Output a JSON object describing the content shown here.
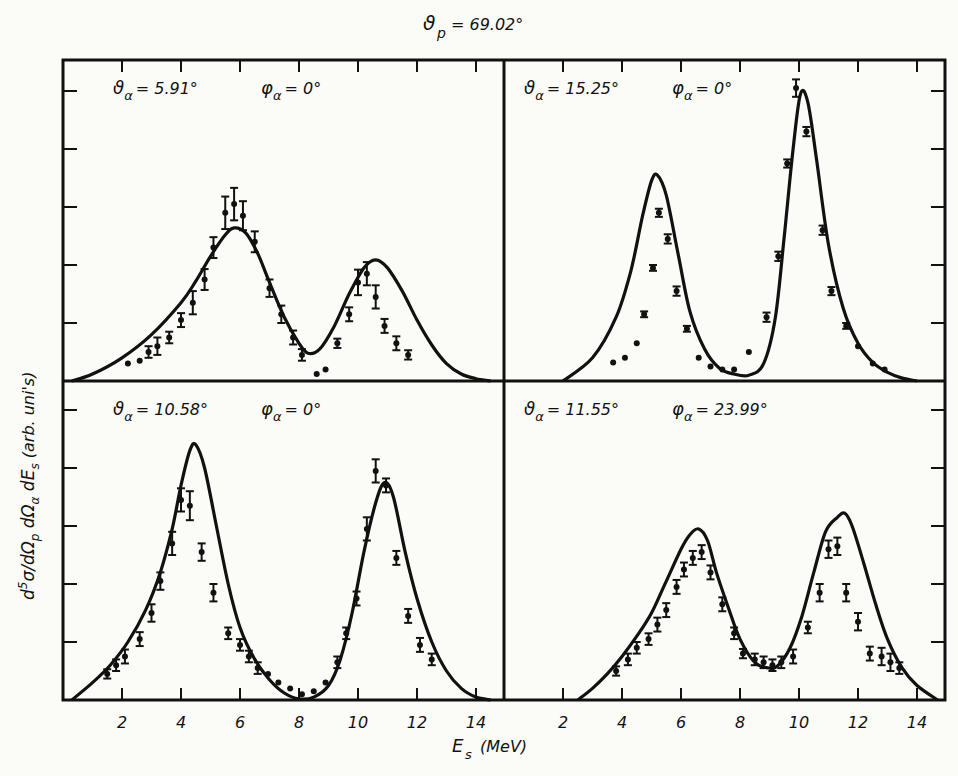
{
  "chart_data": {
    "type": "line",
    "title_parts": {
      "symbol": "ϑ",
      "sub": "p",
      "value": "= 69.02°"
    },
    "xlabel": "Es (MeV)",
    "xlabel_parts": {
      "symbol": "E",
      "sub": "s",
      "unit": "(MeV)"
    },
    "ylabel": "d5σ/dΩp dΩα dEs (arb. units)",
    "ylabel_parts": [
      {
        "t": "d",
        "sup": "5",
        "t2": "σ/dΩ",
        "sub": "p"
      },
      {
        "t": " dΩ",
        "sub": "α"
      },
      {
        "t": " dE",
        "sub": "s"
      },
      {
        "t": "  (arb. uni's)"
      }
    ],
    "x_ticks": [
      2,
      4,
      6,
      8,
      10,
      12,
      14
    ],
    "xlim": [
      0,
      15
    ],
    "ylim": [
      0,
      5.5
    ],
    "y_tick_step": 1,
    "grid": false,
    "legend": null,
    "panels": [
      {
        "id": "top-left",
        "theta_label": "ϑα = 5.91°",
        "phi_label": "φα = 0°",
        "theta": {
          "sym": "ϑ",
          "sub": "α",
          "val": "= 5.91°"
        },
        "phi": {
          "sym": "φ",
          "sub": "α",
          "val": "= 0°"
        },
        "curve": {
          "x": [
            0.3,
            1,
            2,
            3,
            4,
            4.5,
            5,
            5.5,
            5.8,
            6.2,
            6.6,
            7,
            7.5,
            8,
            8.3,
            8.7,
            9.2,
            9.7,
            10.2,
            10.6,
            11,
            11.5,
            12,
            12.5,
            13,
            13.5,
            14,
            14.5
          ],
          "y": [
            0,
            0.12,
            0.4,
            0.8,
            1.35,
            1.72,
            2.15,
            2.52,
            2.64,
            2.55,
            2.2,
            1.7,
            1.1,
            0.65,
            0.48,
            0.55,
            0.95,
            1.5,
            1.95,
            2.09,
            1.95,
            1.55,
            1.05,
            0.62,
            0.3,
            0.12,
            0.04,
            0
          ]
        },
        "points": [
          {
            "x": 2.2,
            "y": 0.3,
            "e": 0
          },
          {
            "x": 2.6,
            "y": 0.35,
            "e": 0
          },
          {
            "x": 2.9,
            "y": 0.5,
            "e": 0.1
          },
          {
            "x": 3.2,
            "y": 0.6,
            "e": 0.15
          },
          {
            "x": 3.6,
            "y": 0.75,
            "e": 0.1
          },
          {
            "x": 4.0,
            "y": 1.05,
            "e": 0.12
          },
          {
            "x": 4.4,
            "y": 1.35,
            "e": 0.2
          },
          {
            "x": 4.8,
            "y": 1.75,
            "e": 0.18
          },
          {
            "x": 5.1,
            "y": 2.3,
            "e": 0.18
          },
          {
            "x": 5.5,
            "y": 2.9,
            "e": 0.28
          },
          {
            "x": 5.8,
            "y": 3.05,
            "e": 0.28
          },
          {
            "x": 6.1,
            "y": 2.85,
            "e": 0.25
          },
          {
            "x": 6.5,
            "y": 2.4,
            "e": 0.18
          },
          {
            "x": 7.0,
            "y": 1.6,
            "e": 0.15
          },
          {
            "x": 7.4,
            "y": 1.15,
            "e": 0.15
          },
          {
            "x": 7.8,
            "y": 0.75,
            "e": 0.12
          },
          {
            "x": 8.1,
            "y": 0.45,
            "e": 0.1
          },
          {
            "x": 8.6,
            "y": 0.12,
            "e": 0
          },
          {
            "x": 8.9,
            "y": 0.2,
            "e": 0
          },
          {
            "x": 9.3,
            "y": 0.65,
            "e": 0.08
          },
          {
            "x": 9.7,
            "y": 1.15,
            "e": 0.12
          },
          {
            "x": 10.0,
            "y": 1.7,
            "e": 0.22
          },
          {
            "x": 10.3,
            "y": 1.85,
            "e": 0.2
          },
          {
            "x": 10.6,
            "y": 1.45,
            "e": 0.2
          },
          {
            "x": 10.9,
            "y": 0.95,
            "e": 0.12
          },
          {
            "x": 11.3,
            "y": 0.65,
            "e": 0.12
          },
          {
            "x": 11.7,
            "y": 0.45,
            "e": 0.08
          }
        ]
      },
      {
        "id": "top-right",
        "theta_label": "ϑα = 15.25°",
        "phi_label": "φα = 0°",
        "theta": {
          "sym": "ϑ",
          "sub": "α",
          "val": "= 15.25°"
        },
        "phi": {
          "sym": "φ",
          "sub": "α",
          "val": "= 0°"
        },
        "curve": {
          "x": [
            2,
            3,
            3.8,
            4.3,
            4.7,
            5.0,
            5.2,
            5.5,
            5.9,
            6.3,
            6.8,
            7.3,
            7.8,
            8.3,
            8.8,
            9.2,
            9.5,
            9.8,
            10.05,
            10.3,
            10.6,
            11,
            11.5,
            12,
            12.5,
            13,
            13.5,
            14
          ],
          "y": [
            0,
            0.4,
            1.1,
            1.9,
            2.85,
            3.45,
            3.55,
            3.2,
            2.2,
            1.2,
            0.55,
            0.22,
            0.12,
            0.1,
            0.3,
            1.1,
            2.5,
            4.0,
            4.95,
            4.8,
            3.8,
            2.35,
            1.25,
            0.65,
            0.32,
            0.15,
            0.05,
            0
          ]
        },
        "points": [
          {
            "x": 3.7,
            "y": 0.32,
            "e": 0
          },
          {
            "x": 4.1,
            "y": 0.4,
            "e": 0
          },
          {
            "x": 4.5,
            "y": 0.65,
            "e": 0
          },
          {
            "x": 4.75,
            "y": 1.15,
            "e": 0.05
          },
          {
            "x": 5.05,
            "y": 1.95,
            "e": 0.05
          },
          {
            "x": 5.25,
            "y": 2.9,
            "e": 0.07
          },
          {
            "x": 5.55,
            "y": 2.45,
            "e": 0.08
          },
          {
            "x": 5.85,
            "y": 1.55,
            "e": 0.08
          },
          {
            "x": 6.2,
            "y": 0.9,
            "e": 0.05
          },
          {
            "x": 6.6,
            "y": 0.4,
            "e": 0
          },
          {
            "x": 7.0,
            "y": 0.25,
            "e": 0
          },
          {
            "x": 7.4,
            "y": 0.2,
            "e": 0
          },
          {
            "x": 7.8,
            "y": 0.2,
            "e": 0
          },
          {
            "x": 8.3,
            "y": 0.5,
            "e": 0
          },
          {
            "x": 8.9,
            "y": 1.1,
            "e": 0.08
          },
          {
            "x": 9.3,
            "y": 2.15,
            "e": 0.08
          },
          {
            "x": 9.6,
            "y": 3.75,
            "e": 0.07
          },
          {
            "x": 9.9,
            "y": 5.05,
            "e": 0.15
          },
          {
            "x": 10.25,
            "y": 4.3,
            "e": 0.08
          },
          {
            "x": 10.8,
            "y": 2.6,
            "e": 0.08
          },
          {
            "x": 11.1,
            "y": 1.55,
            "e": 0.07
          },
          {
            "x": 11.6,
            "y": 0.95,
            "e": 0.05
          },
          {
            "x": 12.0,
            "y": 0.6,
            "e": 0
          },
          {
            "x": 12.5,
            "y": 0.3,
            "e": 0
          },
          {
            "x": 12.9,
            "y": 0.2,
            "e": 0
          }
        ]
      },
      {
        "id": "bottom-left",
        "theta_label": "ϑα = 10.58°",
        "phi_label": "φα = 0°",
        "theta": {
          "sym": "ϑ",
          "sub": "α",
          "val": "= 10.58°"
        },
        "phi": {
          "sym": "φ",
          "sub": "α",
          "val": "= 0°"
        },
        "curve": {
          "x": [
            0.3,
            1,
            1.6,
            2.2,
            2.8,
            3.3,
            3.7,
            4.0,
            4.3,
            4.5,
            4.8,
            5.2,
            5.6,
            6.0,
            6.5,
            7,
            7.5,
            8,
            8.5,
            9,
            9.4,
            9.8,
            10.2,
            10.6,
            10.9,
            11.2,
            11.6,
            12,
            12.5,
            13,
            13.5,
            14,
            14.5
          ],
          "y": [
            0,
            0.3,
            0.6,
            1.0,
            1.55,
            2.2,
            2.95,
            3.7,
            4.3,
            4.4,
            4.0,
            3.0,
            2.0,
            1.25,
            0.7,
            0.35,
            0.12,
            0.02,
            0.05,
            0.25,
            0.7,
            1.5,
            2.55,
            3.4,
            3.75,
            3.5,
            2.55,
            1.75,
            1.0,
            0.5,
            0.2,
            0.05,
            0
          ]
        },
        "points": [
          {
            "x": 1.5,
            "y": 0.45,
            "e": 0.08
          },
          {
            "x": 1.8,
            "y": 0.6,
            "e": 0.1
          },
          {
            "x": 2.1,
            "y": 0.75,
            "e": 0.12
          },
          {
            "x": 2.6,
            "y": 1.05,
            "e": 0.12
          },
          {
            "x": 3.0,
            "y": 1.5,
            "e": 0.15
          },
          {
            "x": 3.3,
            "y": 2.05,
            "e": 0.15
          },
          {
            "x": 3.7,
            "y": 2.7,
            "e": 0.2
          },
          {
            "x": 4.0,
            "y": 3.45,
            "e": 0.2
          },
          {
            "x": 4.3,
            "y": 3.35,
            "e": 0.25
          },
          {
            "x": 4.7,
            "y": 2.55,
            "e": 0.15
          },
          {
            "x": 5.1,
            "y": 1.85,
            "e": 0.15
          },
          {
            "x": 5.6,
            "y": 1.15,
            "e": 0.1
          },
          {
            "x": 6.0,
            "y": 0.95,
            "e": 0.1
          },
          {
            "x": 6.3,
            "y": 0.75,
            "e": 0.1
          },
          {
            "x": 6.6,
            "y": 0.55,
            "e": 0.1
          },
          {
            "x": 6.95,
            "y": 0.45,
            "e": 0
          },
          {
            "x": 7.3,
            "y": 0.3,
            "e": 0
          },
          {
            "x": 7.7,
            "y": 0.2,
            "e": 0
          },
          {
            "x": 8.1,
            "y": 0.1,
            "e": 0
          },
          {
            "x": 8.5,
            "y": 0.15,
            "e": 0
          },
          {
            "x": 8.9,
            "y": 0.3,
            "e": 0
          },
          {
            "x": 9.3,
            "y": 0.65,
            "e": 0.1
          },
          {
            "x": 9.6,
            "y": 1.15,
            "e": 0.1
          },
          {
            "x": 9.95,
            "y": 1.75,
            "e": 0.12
          },
          {
            "x": 10.3,
            "y": 2.95,
            "e": 0.2
          },
          {
            "x": 10.6,
            "y": 3.95,
            "e": 0.2
          },
          {
            "x": 10.95,
            "y": 3.7,
            "e": 0.12
          },
          {
            "x": 11.3,
            "y": 2.45,
            "e": 0.12
          },
          {
            "x": 11.7,
            "y": 1.45,
            "e": 0.12
          },
          {
            "x": 12.1,
            "y": 0.95,
            "e": 0.12
          },
          {
            "x": 12.5,
            "y": 0.7,
            "e": 0.1
          }
        ]
      },
      {
        "id": "bottom-right",
        "theta_label": "ϑα = 11.55°",
        "phi_label": "φα = 23.99°",
        "theta": {
          "sym": "ϑ",
          "sub": "α",
          "val": "= 11.55°"
        },
        "phi": {
          "sym": "φ",
          "sub": "α",
          "val": "= 23.99°"
        },
        "curve": {
          "x": [
            2.5,
            3,
            3.5,
            4,
            4.5,
            5,
            5.5,
            6,
            6.3,
            6.6,
            6.9,
            7.2,
            7.6,
            8,
            8.5,
            9,
            9.3,
            9.7,
            10.1,
            10.5,
            10.9,
            11.3,
            11.55,
            11.8,
            12.2,
            12.6,
            13,
            13.5,
            14,
            14.7
          ],
          "y": [
            0,
            0.2,
            0.45,
            0.75,
            1.1,
            1.5,
            2.05,
            2.6,
            2.85,
            2.95,
            2.75,
            2.2,
            1.6,
            1.05,
            0.65,
            0.55,
            0.6,
            0.9,
            1.45,
            2.2,
            2.9,
            3.15,
            3.22,
            3.0,
            2.35,
            1.65,
            1.05,
            0.55,
            0.25,
            0
          ]
        },
        "points": [
          {
            "x": 3.8,
            "y": 0.5,
            "e": 0.08
          },
          {
            "x": 4.2,
            "y": 0.7,
            "e": 0.1
          },
          {
            "x": 4.5,
            "y": 0.9,
            "e": 0.1
          },
          {
            "x": 4.9,
            "y": 1.05,
            "e": 0.1
          },
          {
            "x": 5.2,
            "y": 1.3,
            "e": 0.12
          },
          {
            "x": 5.5,
            "y": 1.55,
            "e": 0.12
          },
          {
            "x": 5.85,
            "y": 1.95,
            "e": 0.12
          },
          {
            "x": 6.1,
            "y": 2.25,
            "e": 0.12
          },
          {
            "x": 6.4,
            "y": 2.45,
            "e": 0.12
          },
          {
            "x": 6.7,
            "y": 2.55,
            "e": 0.12
          },
          {
            "x": 7.0,
            "y": 2.2,
            "e": 0.12
          },
          {
            "x": 7.4,
            "y": 1.65,
            "e": 0.12
          },
          {
            "x": 7.8,
            "y": 1.15,
            "e": 0.1
          },
          {
            "x": 8.1,
            "y": 0.8,
            "e": 0.08
          },
          {
            "x": 8.5,
            "y": 0.7,
            "e": 0.1
          },
          {
            "x": 8.8,
            "y": 0.65,
            "e": 0.1
          },
          {
            "x": 9.1,
            "y": 0.6,
            "e": 0.1
          },
          {
            "x": 9.4,
            "y": 0.65,
            "e": 0.1
          },
          {
            "x": 9.8,
            "y": 0.75,
            "e": 0.12
          },
          {
            "x": 10.3,
            "y": 1.25,
            "e": 0.1
          },
          {
            "x": 10.7,
            "y": 1.85,
            "e": 0.15
          },
          {
            "x": 11.0,
            "y": 2.6,
            "e": 0.15
          },
          {
            "x": 11.3,
            "y": 2.65,
            "e": 0.15
          },
          {
            "x": 11.6,
            "y": 1.85,
            "e": 0.15
          },
          {
            "x": 12.0,
            "y": 1.35,
            "e": 0.15
          },
          {
            "x": 12.4,
            "y": 0.8,
            "e": 0.12
          },
          {
            "x": 12.8,
            "y": 0.75,
            "e": 0.15
          },
          {
            "x": 13.1,
            "y": 0.65,
            "e": 0.15
          },
          {
            "x": 13.4,
            "y": 0.55,
            "e": 0.1
          }
        ]
      }
    ]
  },
  "colors": {
    "background": "#fbfbf8",
    "ink": "#111111"
  }
}
